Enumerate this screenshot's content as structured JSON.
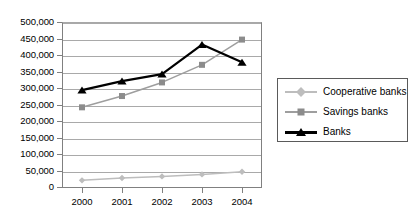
{
  "chart_data": {
    "type": "line",
    "title": "",
    "xlabel": "",
    "ylabel": "",
    "x": [
      "2000",
      "2001",
      "2002",
      "2003",
      "2004"
    ],
    "categories": [
      "2000",
      "2001",
      "2002",
      "2003",
      "2004"
    ],
    "ylim": [
      0,
      500000
    ],
    "ytick_step": 50000,
    "grid": true,
    "legend_position": "right",
    "ytick_labels": [
      "500,000",
      "450,000",
      "400,000",
      "350,000",
      "300,000",
      "250,000",
      "200,000",
      "150,000",
      "100,000",
      "50,000",
      "0"
    ],
    "ytick_values": [
      500000,
      450000,
      400000,
      350000,
      300000,
      250000,
      200000,
      150000,
      100000,
      50000,
      0
    ],
    "series": [
      {
        "name": "Cooperative banks",
        "marker": "diamond",
        "color": "#bdbdbd",
        "line_color": "#bdbdbd",
        "values": [
          23000,
          30000,
          35000,
          41000,
          49000
        ]
      },
      {
        "name": "Savings banks",
        "marker": "square",
        "color": "#8c8c8c",
        "line_color": "#9e9e9e",
        "values": [
          243000,
          277000,
          318000,
          371000,
          447000
        ]
      },
      {
        "name": "Banks",
        "marker": "triangle",
        "color": "#000000",
        "line_color": "#000000",
        "values": [
          295000,
          322000,
          343000,
          432000,
          379000
        ]
      }
    ]
  },
  "legend": {
    "items": [
      {
        "label": "Cooperative banks",
        "marker": "diamond-marker",
        "color": "#bdbdbd"
      },
      {
        "label": "Savings banks",
        "marker": "square-marker",
        "color": "#8c8c8c"
      },
      {
        "label": "Banks",
        "marker": "triangle-marker",
        "color": "#000000"
      }
    ]
  }
}
